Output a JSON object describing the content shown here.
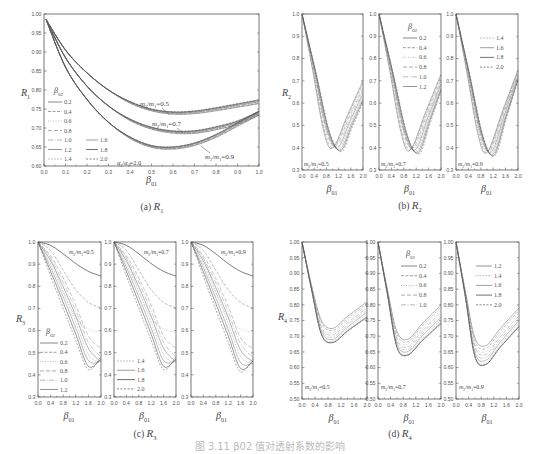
{
  "figure_caption": "图 3.11  β02 值对透射系数的影响",
  "chart_data": [
    {
      "id": "a",
      "type": "line",
      "caption_prefix": "(a)",
      "caption_var": "R",
      "caption_sub": "1",
      "ylabel": "R",
      "ylabel_sub": "1",
      "xlabel": "β",
      "xlabel_sub": "01",
      "xlim": [
        0,
        1.0
      ],
      "ylim": [
        0.6,
        1.0
      ],
      "xticks": [
        "0.0",
        "0.1",
        "0.2",
        "0.3",
        "0.4",
        "0.5",
        "0.6",
        "0.7",
        "0.8",
        "0.9",
        "1.0"
      ],
      "yticks": [
        "0.60",
        "0.65",
        "0.70",
        "0.75",
        "0.80",
        "0.85",
        "0.90",
        "0.95",
        "1.00"
      ],
      "legend_title": "β02",
      "legend_col1": [
        "0.2",
        "0.4",
        "0.6",
        "0.8",
        "1.0",
        "1.2",
        "1.4"
      ],
      "legend_col2": [
        "1.6",
        "1.8",
        "2.0"
      ],
      "annotation": "α2/α1=2.0",
      "groups": [
        {
          "label": "m2/m1=0.5",
          "x": [
            0.01,
            0.1,
            0.2,
            0.3,
            0.4,
            0.5,
            0.6,
            0.7,
            0.8,
            0.9,
            1.0
          ],
          "y": [
            0.985,
            0.905,
            0.845,
            0.8,
            0.768,
            0.748,
            0.74,
            0.742,
            0.75,
            0.76,
            0.77
          ]
        },
        {
          "label": "m2/m1=0.7",
          "x": [
            0.01,
            0.1,
            0.2,
            0.3,
            0.4,
            0.5,
            0.6,
            0.7,
            0.8,
            0.9,
            1.0
          ],
          "y": [
            0.985,
            0.885,
            0.81,
            0.758,
            0.722,
            0.7,
            0.69,
            0.69,
            0.7,
            0.715,
            0.74
          ]
        },
        {
          "label": "m2/m1=0.9",
          "x": [
            0.01,
            0.1,
            0.2,
            0.3,
            0.4,
            0.5,
            0.6,
            0.7,
            0.8,
            0.9,
            1.0
          ],
          "y": [
            0.985,
            0.86,
            0.775,
            0.715,
            0.675,
            0.652,
            0.648,
            0.658,
            0.68,
            0.71,
            0.74
          ]
        }
      ]
    },
    {
      "id": "b",
      "type": "line",
      "caption_prefix": "(b)",
      "caption_var": "R",
      "caption_sub": "2",
      "ylabel": "R",
      "ylabel_sub": "2",
      "xlabel": "β",
      "xlabel_sub": "01",
      "xlim": [
        0,
        2.0
      ],
      "ylim": [
        0.3,
        1.0
      ],
      "xticks": [
        "0.0",
        "0.4",
        "0.8",
        "1.2",
        "1.6",
        "2.0"
      ],
      "yticks": [
        "0.3",
        "0.4",
        "0.5",
        "0.6",
        "0.7",
        "0.8",
        "0.9",
        "1.0"
      ],
      "legend_title": "β02",
      "legend_a": [
        "0.2",
        "0.4",
        "0.6",
        "0.8",
        "1.0",
        "1.2"
      ],
      "legend_b": [
        "1.4",
        "1.6",
        "1.8",
        "2.0"
      ],
      "subplots": [
        {
          "label": "m2/m1=0.5",
          "min_x_range": [
            1.0,
            1.3
          ],
          "min_y_range": [
            0.37,
            0.41
          ],
          "end_y_range": [
            0.6,
            0.7
          ]
        },
        {
          "label": "m2/m1=0.7",
          "min_x_range": [
            1.0,
            1.3
          ],
          "min_y_range": [
            0.36,
            0.4
          ],
          "end_y_range": [
            0.65,
            0.73
          ]
        },
        {
          "label": "m2/m1=0.9",
          "min_x_range": [
            1.0,
            1.25
          ],
          "min_y_range": [
            0.35,
            0.39
          ],
          "end_y_range": [
            0.7,
            0.75
          ]
        }
      ]
    },
    {
      "id": "c",
      "type": "line",
      "caption_prefix": "(c)",
      "caption_var": "R",
      "caption_sub": "3",
      "ylabel": "R",
      "ylabel_sub": "3",
      "xlabel": "β",
      "xlabel_sub": "01",
      "xlim": [
        0,
        2.0
      ],
      "ylim": [
        0.3,
        1.0
      ],
      "xticks": [
        "0.0",
        "0.4",
        "0.8",
        "1.2",
        "1.6",
        "2.0"
      ],
      "yticks": [
        "0.3",
        "0.4",
        "0.5",
        "0.6",
        "0.7",
        "0.8",
        "0.9",
        "1.0"
      ],
      "legend_title": "β02",
      "legend_a": [
        "0.2",
        "0.4",
        "0.6",
        "0.8",
        "1.0",
        "1.2"
      ],
      "legend_b": [
        "1.4",
        "1.6",
        "1.8",
        "2.0"
      ],
      "series_end_values": [
        0.83,
        0.69,
        0.59,
        0.52,
        0.48,
        0.46,
        0.45,
        0.44,
        0.43,
        0.43
      ],
      "subplots": [
        {
          "label": "m2/m1=0.5"
        },
        {
          "label": "m2/m1=0.7"
        },
        {
          "label": "m2/m1=0.9"
        }
      ]
    },
    {
      "id": "d",
      "type": "line",
      "caption_prefix": "(d)",
      "caption_var": "R",
      "caption_sub": "4",
      "ylabel": "R",
      "ylabel_sub": "4",
      "xlabel": "β",
      "xlabel_sub": "01",
      "xlim": [
        0,
        2.0
      ],
      "ylim": [
        0.5,
        1.0
      ],
      "xticks": [
        "0.0",
        "0.4",
        "0.8",
        "1.2",
        "1.6",
        "2.0"
      ],
      "yticks": [
        "0.50",
        "0.55",
        "0.60",
        "0.65",
        "0.70",
        "0.75",
        "0.80",
        "0.85",
        "0.90",
        "0.95",
        "1.00"
      ],
      "legend_title": "β02",
      "legend_a": [
        "0.2",
        "0.4",
        "0.6",
        "0.8",
        "1.0"
      ],
      "legend_b": [
        "1.2",
        "1.4",
        "1.6",
        "1.8",
        "2.0"
      ],
      "subplots": [
        {
          "label": "m2/m1=0.5",
          "min_top": 0.725,
          "min_bottom": 0.68,
          "end_top": 0.81,
          "end_bottom": 0.76
        },
        {
          "label": "m2/m1=0.7",
          "min_top": 0.69,
          "min_bottom": 0.64,
          "end_top": 0.8,
          "end_bottom": 0.74
        },
        {
          "label": "m2/m1=0.9",
          "min_top": 0.67,
          "min_bottom": 0.61,
          "end_top": 0.79,
          "end_bottom": 0.73
        }
      ]
    }
  ]
}
